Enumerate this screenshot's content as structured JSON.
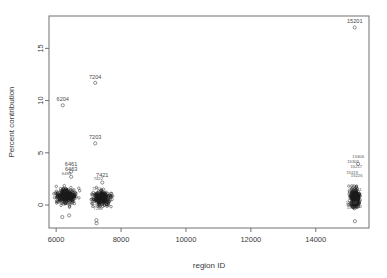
{
  "figure": {
    "background": "#ffffff",
    "frame_color": "#707070",
    "point_color": "#1a1a1a",
    "text_color": "#3a3a3a"
  },
  "chart_data": {
    "type": "scatter",
    "title": "",
    "xlabel": "region ID",
    "ylabel": "Percent contribution",
    "xlim": [
      5780,
      15640
    ],
    "ylim": [
      -2.2,
      18.1
    ],
    "xticks": [
      6000,
      8000,
      10000,
      12000,
      14000
    ],
    "xtick_labels": [
      "6000",
      "8000",
      "10000",
      "12000",
      "14000"
    ],
    "yticks": [
      0,
      5,
      10,
      15
    ],
    "ytick_labels": [
      "0",
      "5",
      "10",
      "15"
    ],
    "grid": false,
    "legend": null,
    "marker": "open-circle",
    "annotations": [
      {
        "label": "15201",
        "x": 15201,
        "y": 17.0
      },
      {
        "label": "7204",
        "x": 7204,
        "y": 11.7
      },
      {
        "label": "6204",
        "x": 6204,
        "y": 9.55
      },
      {
        "label": "7203",
        "x": 7203,
        "y": 5.9
      },
      {
        "label": "6461",
        "x": 6461,
        "y": 3.35
      },
      {
        "label": "6463",
        "x": 6463,
        "y": 2.85
      },
      {
        "label": "15306",
        "x": 15306,
        "y": 4.1
      },
      {
        "label": "7421",
        "x": 7421,
        "y": 2.3
      },
      {
        "label": "6499",
        "x": 6320,
        "y": 2.45
      },
      {
        "label": "6322",
        "x": 6140,
        "y": -0.35
      },
      {
        "label": "6362",
        "x": 6420,
        "y": -0.4
      },
      {
        "label": "7422",
        "x": 7300,
        "y": 2.0
      },
      {
        "label": "7261",
        "x": 7250,
        "y": 1.05
      },
      {
        "label": "7299",
        "x": 7230,
        "y": -0.55
      },
      {
        "label": "7288",
        "x": 7290,
        "y": -0.9
      },
      {
        "label": "15302",
        "x": 15150,
        "y": 3.6
      },
      {
        "label": "15217",
        "x": 15250,
        "y": 3.1
      },
      {
        "label": "15119",
        "x": 15120,
        "y": 2.6
      },
      {
        "label": "15226",
        "x": 15260,
        "y": 2.25
      },
      {
        "label": "15461",
        "x": 15230,
        "y": 0.9
      },
      {
        "label": "15108",
        "x": 15100,
        "y": -0.3
      },
      {
        "label": "15119",
        "x": 15130,
        "y": -0.75
      }
    ],
    "clusters": [
      {
        "name": "cluster-6000",
        "x_center": 6300,
        "x_spread": 290,
        "y_center": 0.85,
        "y_spread": 0.62,
        "n": 260
      },
      {
        "name": "cluster-7400",
        "x_center": 7390,
        "x_spread": 250,
        "y_center": 0.7,
        "y_spread": 0.6,
        "n": 250
      },
      {
        "name": "cluster-15200",
        "x_center": 15210,
        "x_spread": 130,
        "y_center": 0.7,
        "y_spread": 0.75,
        "n": 300
      }
    ],
    "outlier_points": [
      {
        "x": 15201,
        "y": 17.0
      },
      {
        "x": 7204,
        "y": 11.7
      },
      {
        "x": 6204,
        "y": 9.55
      },
      {
        "x": 7203,
        "y": 5.9
      },
      {
        "x": 6461,
        "y": 3.2
      },
      {
        "x": 6463,
        "y": 2.7
      },
      {
        "x": 15306,
        "y": 3.95
      },
      {
        "x": 7421,
        "y": 2.15
      },
      {
        "x": 6190,
        "y": -1.15
      },
      {
        "x": 6400,
        "y": -1.0
      },
      {
        "x": 7240,
        "y": -1.45
      },
      {
        "x": 7245,
        "y": -1.75
      },
      {
        "x": 15205,
        "y": -1.55
      }
    ]
  }
}
